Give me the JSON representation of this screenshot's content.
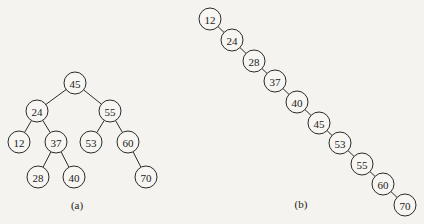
{
  "diagram": {
    "type": "binary-search-trees",
    "trees": [
      {
        "id": "a",
        "caption": "(a)",
        "caption_pos": [
          77,
          205
        ],
        "nodes": [
          {
            "value": "45",
            "x": 75,
            "y": 83
          },
          {
            "value": "24",
            "x": 37,
            "y": 111
          },
          {
            "value": "55",
            "x": 110,
            "y": 111
          },
          {
            "value": "12",
            "x": 19,
            "y": 142
          },
          {
            "value": "37",
            "x": 56,
            "y": 142
          },
          {
            "value": "53",
            "x": 91,
            "y": 142
          },
          {
            "value": "60",
            "x": 128,
            "y": 142
          },
          {
            "value": "28",
            "x": 38,
            "y": 177
          },
          {
            "value": "40",
            "x": 74,
            "y": 177
          },
          {
            "value": "70",
            "x": 146,
            "y": 177
          }
        ],
        "edges": [
          [
            "45",
            "24"
          ],
          [
            "45",
            "55"
          ],
          [
            "24",
            "12"
          ],
          [
            "24",
            "37"
          ],
          [
            "55",
            "53"
          ],
          [
            "55",
            "60"
          ],
          [
            "37",
            "28"
          ],
          [
            "37",
            "40"
          ],
          [
            "60",
            "70"
          ]
        ]
      },
      {
        "id": "b",
        "caption": "(b)",
        "caption_pos": [
          301,
          204
        ],
        "nodes": [
          {
            "value": "12",
            "x": 210,
            "y": 19
          },
          {
            "value": "24",
            "x": 232,
            "y": 40
          },
          {
            "value": "28",
            "x": 254,
            "y": 61
          },
          {
            "value": "37",
            "x": 275,
            "y": 81
          },
          {
            "value": "40",
            "x": 297,
            "y": 102
          },
          {
            "value": "45",
            "x": 319,
            "y": 123
          },
          {
            "value": "53",
            "x": 340,
            "y": 143
          },
          {
            "value": "55",
            "x": 362,
            "y": 164
          },
          {
            "value": "60",
            "x": 383,
            "y": 184
          },
          {
            "value": "70",
            "x": 405,
            "y": 205
          }
        ],
        "edges": [
          [
            "12",
            "24"
          ],
          [
            "24",
            "28"
          ],
          [
            "28",
            "37"
          ],
          [
            "37",
            "40"
          ],
          [
            "40",
            "45"
          ],
          [
            "45",
            "53"
          ],
          [
            "53",
            "55"
          ],
          [
            "55",
            "60"
          ],
          [
            "60",
            "70"
          ]
        ]
      }
    ],
    "node_radius": 11,
    "colors": {
      "background": "#f4f3ef",
      "stroke": "#2a2a2a",
      "node_fill": "#f7f6f2",
      "text": "#1a1a1a"
    }
  }
}
